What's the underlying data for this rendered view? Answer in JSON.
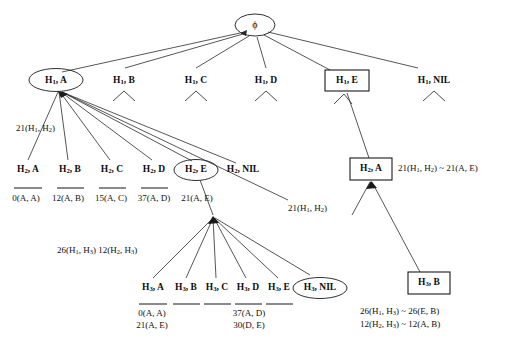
{
  "diagram": {
    "root": {
      "label": "ϕ",
      "name": "root-phi"
    },
    "levels": [
      {
        "level_name": "H1-row",
        "nodes": [
          {
            "label": "H₁, A",
            "base": "H",
            "sub": "1",
            "rest": ", A",
            "shape": "ellipse",
            "expanded": true
          },
          {
            "label": "H₁, B",
            "base": "H",
            "sub": "1",
            "rest": ", B",
            "shape": "none",
            "expanded": false
          },
          {
            "label": "H₁, C",
            "base": "H",
            "sub": "1",
            "rest": ", C",
            "shape": "none",
            "expanded": false
          },
          {
            "label": "H₁, D",
            "base": "H",
            "sub": "1",
            "rest": ", D",
            "shape": "none",
            "expanded": false
          },
          {
            "label": "H₁, E",
            "base": "H",
            "sub": "1",
            "rest": ", E",
            "shape": "rect",
            "expanded": true
          },
          {
            "label": "H₁, NIL",
            "base": "H",
            "sub": "1",
            "rest": ", NIL",
            "shape": "none",
            "expanded": false
          }
        ]
      },
      {
        "level_name": "H2-row-left",
        "nodes": [
          {
            "label": "H₂, A",
            "base": "H",
            "sub": "2",
            "rest": ", A",
            "shape": "none",
            "expanded": false
          },
          {
            "label": "H₂, B",
            "base": "H",
            "sub": "2",
            "rest": ", B",
            "shape": "none",
            "expanded": false
          },
          {
            "label": "H₂, C",
            "base": "H",
            "sub": "2",
            "rest": ", C",
            "shape": "none",
            "expanded": false
          },
          {
            "label": "H₂, D",
            "base": "H",
            "sub": "2",
            "rest": ", D",
            "shape": "none",
            "expanded": false
          },
          {
            "label": "H₂, E",
            "base": "H",
            "sub": "2",
            "rest": ", E",
            "shape": "ellipse",
            "expanded": true
          },
          {
            "label": "H₂, NIL",
            "base": "H",
            "sub": "2",
            "rest": ", NIL",
            "shape": "none",
            "expanded": false
          }
        ]
      },
      {
        "level_name": "H2-row-right",
        "nodes": [
          {
            "label": "H₂, A",
            "base": "H",
            "sub": "2",
            "rest": ", A",
            "shape": "rect",
            "expanded": true
          }
        ]
      },
      {
        "level_name": "H3-row",
        "nodes": [
          {
            "label": "H₃, A",
            "base": "H",
            "sub": "3",
            "rest": ", A",
            "shape": "none",
            "expanded": false
          },
          {
            "label": "H₃, B",
            "base": "H",
            "sub": "3",
            "rest": ", B",
            "shape": "none",
            "expanded": false
          },
          {
            "label": "H₃, C",
            "base": "H",
            "sub": "3",
            "rest": ", C",
            "shape": "none",
            "expanded": false
          },
          {
            "label": "H₃, D",
            "base": "H",
            "sub": "3",
            "rest": ", D",
            "shape": "none",
            "expanded": false
          },
          {
            "label": "H₃, E",
            "base": "H",
            "sub": "3",
            "rest": ", E",
            "shape": "none",
            "expanded": false
          },
          {
            "label": "H₃, NIL",
            "base": "H",
            "sub": "3",
            "rest": ", NIL",
            "shape": "ellipse",
            "expanded": false
          }
        ]
      },
      {
        "level_name": "H3-row-right",
        "nodes": [
          {
            "label": "H₃, B",
            "base": "H",
            "sub": "3",
            "rest": ", B",
            "shape": "rect",
            "expanded": false
          }
        ]
      }
    ],
    "annotations": {
      "h1a_cost": "21(H₁, H₂)",
      "h2_costs": [
        "0(A, A)",
        "12(A, B)",
        "15(A, C)",
        "37(A, D)",
        "21(A, E)"
      ],
      "h2nil_cost": "21(H₁, H₂)",
      "h2a_box_note": "21(H₁, H₂) ~ 21(A, E)",
      "h3_parent_costs": "26(H₁, H₃) 12(H₂, H₃)",
      "h3_cost_a_line1": "0(A, A)",
      "h3_cost_a_line2": "21(A, E)",
      "h3_cost_d_line1": "37(A, D)",
      "h3_cost_d_line2": "30(D, E)",
      "h3b_box_note_line1": "26(H₁, H₃) ~ 26(E, B)",
      "h3b_box_note_line2": "12(H₂, H₃) ~ 12(A, B)"
    },
    "colors": {
      "stroke": "#1a1a1a",
      "edge": "#2b2b2b",
      "text": "#0d0d0d",
      "background": "#ffffff"
    }
  }
}
